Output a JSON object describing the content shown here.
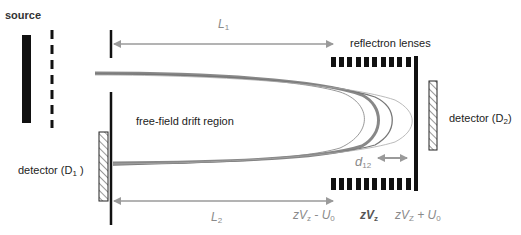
{
  "labels": {
    "source": "source",
    "reflectron_lenses": "reflectron lenses",
    "free_field": "free-field drift region",
    "detector_d1": {
      "text": "detector (D",
      "sub": "1",
      "close": " )"
    },
    "detector_d2": {
      "text": "detector (D",
      "sub": "2",
      "close": ")"
    }
  },
  "dimensions": {
    "L1": {
      "main": "L",
      "sub": "1"
    },
    "L2": {
      "main": "L",
      "sub": "2"
    },
    "d12": {
      "main": "d",
      "sub": "12"
    }
  },
  "potentials": {
    "low": {
      "pre": "zV",
      "sub": "z",
      "post": " - U",
      "post_sub": "0"
    },
    "mid": {
      "pre": "zV",
      "sub": "z"
    },
    "high": {
      "pre": "zV",
      "sub": "Z",
      "post": " + U",
      "post_sub": "0"
    }
  },
  "colors": {
    "element": "#111111",
    "arrow": "#9a9a9a",
    "beam": "#8c8c8c",
    "label": "#222222"
  }
}
